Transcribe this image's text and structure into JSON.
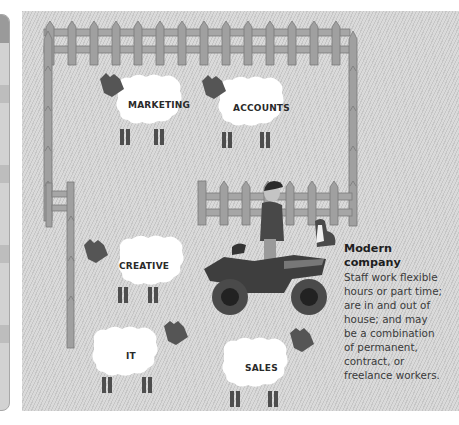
{
  "illustration": {
    "sheep": [
      {
        "label": "MARKETING"
      },
      {
        "label": "ACCOUNTS"
      },
      {
        "label": "CREATIVE"
      },
      {
        "label": "IT"
      },
      {
        "label": "SALES"
      }
    ],
    "caption": {
      "title_line1": "Modern",
      "title_line2": "company",
      "body": [
        "Staff work flexible",
        "hours or part time;",
        "are in and out of",
        "house; and may",
        "be a combination",
        "of permanent,",
        "contract, or",
        "freelance workers."
      ]
    },
    "colors": {
      "background": "#d4d4d4",
      "fence": "#9e9e9e",
      "sheep_body": "#ffffff",
      "sheep_head": "#555555",
      "text": "#2a2a2a"
    }
  }
}
